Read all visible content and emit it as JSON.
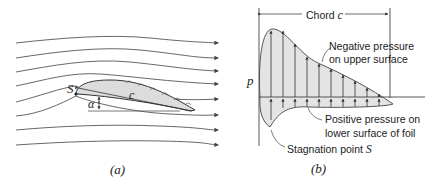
{
  "panel_a": {
    "caption": "(a)",
    "stagnation_label": "S",
    "chord_label": "c",
    "angle_label": "α",
    "streamline_count": 8
  },
  "panel_b": {
    "caption": "(b)",
    "axis_label": "p",
    "chord_label_text": "Chord ",
    "chord_label_var": "c",
    "upper_annotation_line1": "Negative pressure",
    "upper_annotation_line2": "on upper surface",
    "lower_annotation_line1": "Positive pressure on",
    "lower_annotation_line2": "lower surface of foil",
    "stagnation_annotation_text": "Stagnation point ",
    "stagnation_annotation_var": "S"
  },
  "colors": {
    "stroke": "#444444",
    "fill": "#e4e4e4",
    "text": "#222222"
  }
}
